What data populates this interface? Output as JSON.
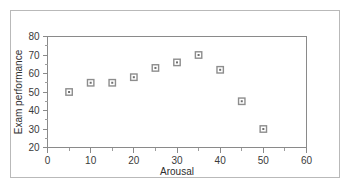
{
  "chart_data": {
    "type": "scatter",
    "title": "",
    "xlabel": "Arousal",
    "ylabel": "Exam performance",
    "xlim": [
      0,
      60
    ],
    "ylim": [
      20,
      80
    ],
    "grid": false,
    "legend": null,
    "x_ticks": [
      0,
      10,
      20,
      30,
      40,
      50,
      60
    ],
    "x_tick_labels": [
      "0",
      "10",
      "20",
      "30",
      "40",
      "50",
      "60"
    ],
    "x_minor_ticks": [
      5,
      15,
      25,
      35,
      45,
      55
    ],
    "y_ticks": [
      20,
      30,
      40,
      50,
      60,
      70,
      80
    ],
    "y_tick_labels": [
      "20",
      "30",
      "40",
      "50",
      "60",
      "70",
      "80"
    ],
    "y_minor_ticks": [
      25,
      35,
      45,
      55,
      65,
      75
    ],
    "marker": "open-square-with-center-dot",
    "marker_color": "#8d8d8d",
    "points": [
      {
        "x": 5,
        "y": 50
      },
      {
        "x": 10,
        "y": 55
      },
      {
        "x": 15,
        "y": 55
      },
      {
        "x": 20,
        "y": 58
      },
      {
        "x": 25,
        "y": 63
      },
      {
        "x": 30,
        "y": 66
      },
      {
        "x": 35,
        "y": 70
      },
      {
        "x": 40,
        "y": 62
      },
      {
        "x": 45,
        "y": 45
      },
      {
        "x": 50,
        "y": 30
      }
    ],
    "x": [
      5,
      10,
      15,
      20,
      25,
      30,
      35,
      40,
      45,
      50
    ],
    "values": [
      50,
      55,
      55,
      58,
      63,
      66,
      70,
      62,
      45,
      30
    ]
  },
  "figure": {
    "border_color": "#b9b9b9",
    "axis_color": "#8a8a8a",
    "background": "#ffffff"
  }
}
